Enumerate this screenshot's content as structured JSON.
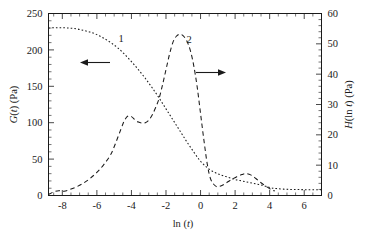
{
  "chart_data": {
    "type": "line",
    "title": "",
    "xlabel": "ln (t)",
    "ylabel": "G(t) (Pa)",
    "y2label": "H(ln t) (Pa)",
    "xlim": [
      -8.8,
      7.0
    ],
    "ylim": [
      0,
      250
    ],
    "y2lim": [
      0,
      60
    ],
    "xticks": [
      -8,
      -6,
      -4,
      -2,
      0,
      2,
      4,
      6
    ],
    "xtick_labels": [
      "-8",
      "-6",
      "-4",
      "-2",
      "0",
      "2",
      "4",
      "6"
    ],
    "yticks": [
      0,
      50,
      100,
      150,
      200,
      250
    ],
    "ytick_labels": [
      "0",
      "50",
      "100",
      "150",
      "200",
      "250"
    ],
    "y2ticks": [
      0,
      10,
      20,
      30,
      40,
      50,
      60
    ],
    "y2tick_labels": [
      "0",
      "10",
      "20",
      "30",
      "40",
      "50",
      "60"
    ],
    "x_minor_step": 0.5,
    "y_minor_step": 10,
    "y2_minor_step": 2,
    "grid": false,
    "legend_position": "inline-annotations",
    "series": [
      {
        "name": "1",
        "label": "1",
        "axis": "left",
        "style": "dotted",
        "color": "#1a1a1a",
        "x": [
          -8.8,
          -8.4,
          -8.0,
          -7.6,
          -7.2,
          -6.8,
          -6.4,
          -6.0,
          -5.6,
          -5.2,
          -4.8,
          -4.4,
          -4.0,
          -3.6,
          -3.2,
          -2.8,
          -2.4,
          -2.0,
          -1.6,
          -1.2,
          -0.8,
          -0.4,
          0.0,
          0.4,
          0.8,
          1.2,
          1.6,
          2.0,
          2.4,
          2.8,
          3.2,
          3.6,
          4.0,
          4.4,
          5.0,
          5.6,
          6.2,
          7.0
        ],
        "y": [
          230,
          230.5,
          230.5,
          230,
          229,
          227,
          224.5,
          221,
          216,
          210,
          203,
          194,
          184,
          173,
          161,
          148,
          134,
          119,
          104,
          89,
          74,
          60,
          47,
          38,
          32,
          28,
          25,
          22,
          20,
          18,
          16,
          14,
          11,
          9.5,
          8.5,
          8.2,
          8.0,
          8.0
        ]
      },
      {
        "name": "2",
        "label": "2",
        "axis": "right",
        "style": "dashed",
        "color": "#1a1a1a",
        "x": [
          -8.8,
          -8.5,
          -8.2,
          -7.9,
          -7.6,
          -7.2,
          -6.8,
          -6.4,
          -6.0,
          -5.6,
          -5.2,
          -4.9,
          -4.6,
          -4.4,
          -4.2,
          -4.0,
          -3.8,
          -3.6,
          -3.4,
          -3.2,
          -3.0,
          -2.8,
          -2.6,
          -2.4,
          -2.2,
          -2.0,
          -1.8,
          -1.6,
          -1.4,
          -1.2,
          -1.0,
          -0.8,
          -0.6,
          -0.4,
          -0.2,
          0.0,
          0.2,
          0.4,
          0.6,
          0.9,
          1.2,
          1.5,
          1.8,
          2.1,
          2.4,
          2.6,
          2.9,
          3.2,
          3.5,
          3.8,
          4.1,
          4.3
        ],
        "y": [
          0.3,
          1.2,
          1.6,
          1.4,
          1.9,
          2.8,
          4.0,
          5.6,
          7.6,
          10.2,
          13.5,
          17.5,
          22.0,
          24.8,
          26.2,
          26.0,
          25.0,
          24.2,
          23.9,
          24.0,
          24.8,
          26.5,
          29.0,
          32.0,
          36.5,
          41.5,
          46.5,
          50.5,
          52.5,
          53.2,
          52.6,
          51.0,
          48.0,
          43.0,
          36.0,
          27.0,
          18.0,
          10.0,
          5.2,
          3.0,
          3.2,
          4.2,
          5.3,
          6.2,
          6.9,
          7.2,
          6.8,
          5.6,
          4.2,
          3.0,
          1.9,
          1.5
        ]
      }
    ],
    "annotations": [
      {
        "name": "left-axis-pointer",
        "text": "",
        "direction": "left",
        "x_data": -6.2,
        "y_frac": 0.77
      },
      {
        "name": "right-axis-pointer",
        "text": "",
        "direction": "right",
        "x_data": -1.3,
        "y_frac": 0.69
      }
    ]
  }
}
